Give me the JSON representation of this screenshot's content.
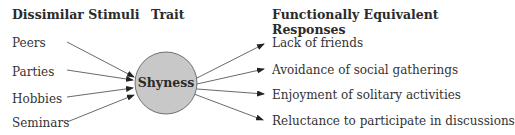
{
  "headers": {
    "stimuli": "Dissimilar Stimuli",
    "trait": "Trait",
    "responses": "Functionally Equivalent Responses"
  },
  "trait": {
    "label": "Shyness",
    "fill": "#c8c8c8"
  },
  "stimuli": [
    "Peers",
    "Parties",
    "Hobbies",
    "Seminars"
  ],
  "responses": [
    "Lack of friends",
    "Avoidance of social gatherings",
    "Enjoyment of solitary activities",
    "Reluctance to participate in discussions"
  ]
}
